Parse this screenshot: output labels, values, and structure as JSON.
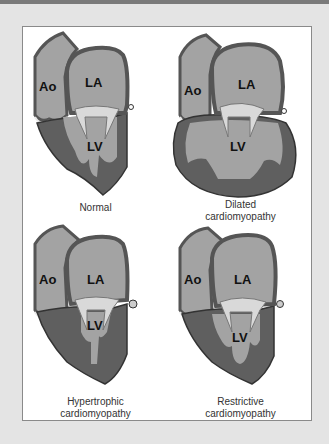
{
  "figure": {
    "panels": [
      {
        "id": "normal",
        "caption_lines": [
          "Normal"
        ],
        "labels": {
          "ao": "Ao",
          "la": "LA",
          "lv": "LV"
        }
      },
      {
        "id": "dilated",
        "caption_lines": [
          "Dilated",
          "cardiomyopathy"
        ],
        "labels": {
          "ao": "Ao",
          "la": "LA",
          "lv": "LV"
        }
      },
      {
        "id": "hypertrophic",
        "caption_lines": [
          "Hypertrophic",
          "cardiomyopathy"
        ],
        "labels": {
          "ao": "Ao",
          "la": "LA",
          "lv": "LV"
        }
      },
      {
        "id": "restrictive",
        "caption_lines": [
          "Restrictive",
          "cardiomyopathy"
        ],
        "labels": {
          "ao": "Ao",
          "la": "LA",
          "lv": "LV"
        }
      }
    ],
    "colors": {
      "background": "#e4e4e4",
      "panel": "#ffffff",
      "wall": "#5f5f5f",
      "chamber": "#a3a3a3",
      "valve": "#d9d9d9",
      "outline": "#333333"
    }
  }
}
